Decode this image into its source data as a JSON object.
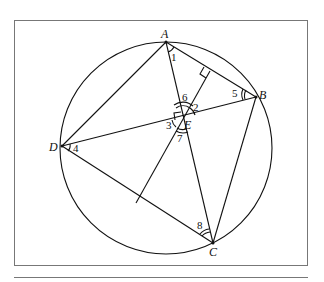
{
  "diagram": {
    "type": "geometry",
    "circle": {
      "cx": 166,
      "cy": 148,
      "r": 106
    },
    "points": {
      "A": {
        "label": "A",
        "x": 166,
        "y": 42
      },
      "B": {
        "label": "B",
        "x": 256,
        "y": 97
      },
      "C": {
        "label": "C",
        "x": 213,
        "y": 243
      },
      "D": {
        "label": "D",
        "x": 62,
        "y": 146
      },
      "E": {
        "label": "E",
        "x": 183,
        "y": 118
      },
      "F": {
        "label": "",
        "x": 210,
        "y": 71
      },
      "G": {
        "label": "",
        "x": 136,
        "y": 203
      }
    },
    "angle_labels": [
      "1",
      "2",
      "3",
      "4",
      "5",
      "6",
      "7",
      "8"
    ],
    "stroke_color": "#111111"
  }
}
